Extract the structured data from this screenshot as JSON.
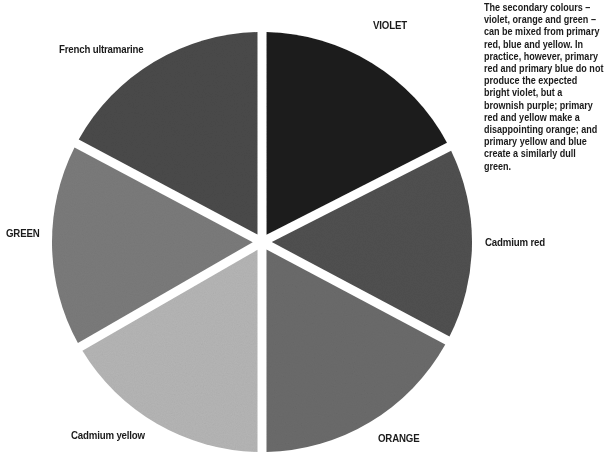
{
  "caption": {
    "text": "The secondary colours – violet, orange and green – can be mixed from primary red, blue and yellow. In practice, however, primary red and primary blue do not produce the expected bright violet, but a brownish purple; primary red and yellow make a disappointing orange; and primary yellow and blue create a similarly dull green."
  },
  "wheel": {
    "center": [
      262,
      242
    ],
    "radius": 210,
    "gap_width": 9,
    "segments": [
      {
        "name": "violet",
        "label": "VIOLET",
        "start_deg": 90,
        "end_deg": 27,
        "color": "#1e1e1e"
      },
      {
        "name": "cadmium-red",
        "label": "Cadmium red",
        "start_deg": 27,
        "end_deg": -28,
        "color": "#505050"
      },
      {
        "name": "orange",
        "label": "ORANGE",
        "start_deg": -28,
        "end_deg": -90,
        "color": "#6b6b6b"
      },
      {
        "name": "cadmium-yellow",
        "label": "Cadmium yellow",
        "start_deg": -90,
        "end_deg": -150,
        "color": "#b5b5b5"
      },
      {
        "name": "green",
        "label": "GREEN",
        "start_deg": -150,
        "end_deg": -208,
        "color": "#7b7b7b"
      },
      {
        "name": "french-ultramarine",
        "label": "French ultramarine",
        "start_deg": 152,
        "end_deg": 90,
        "color": "#4a4a4a"
      }
    ]
  },
  "labels": {
    "french_ultramarine": "French ultramarine",
    "violet": "VIOLET",
    "green": "GREEN",
    "cadmium_red": "Cadmium red",
    "cadmium_yellow": "Cadmium yellow",
    "orange": "ORANGE"
  }
}
